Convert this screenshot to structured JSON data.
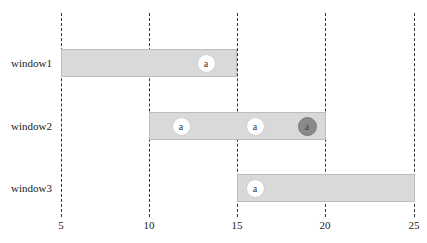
{
  "axis": {
    "ticks": [
      {
        "value": 5,
        "label": "5",
        "x": 61
      },
      {
        "value": 10,
        "label": "10",
        "x": 149
      },
      {
        "value": 15,
        "label": "15",
        "x": 237
      },
      {
        "value": 20,
        "label": "20",
        "x": 325
      },
      {
        "value": 25,
        "label": "25",
        "x": 414
      }
    ]
  },
  "windows": [
    {
      "label": "window1",
      "start": 5,
      "end": 15,
      "events": [
        {
          "label": "a",
          "time": 13.2,
          "state": "on-time"
        }
      ]
    },
    {
      "label": "window2",
      "start": 10,
      "end": 20,
      "events": [
        {
          "label": "a",
          "time": 11.9,
          "state": "on-time"
        },
        {
          "label": "a",
          "time": 16.1,
          "state": "on-time"
        },
        {
          "label": "a",
          "time": 19.1,
          "state": "late"
        }
      ]
    },
    {
      "label": "window3",
      "start": 15,
      "end": 25,
      "events": [
        {
          "label": "a",
          "time": 16.0,
          "state": "on-time"
        }
      ]
    }
  ],
  "colors": {
    "bar_fill": "#d9d9d9",
    "event_fill": "#ffffff",
    "late_event_fill": "#8a8a8a"
  }
}
